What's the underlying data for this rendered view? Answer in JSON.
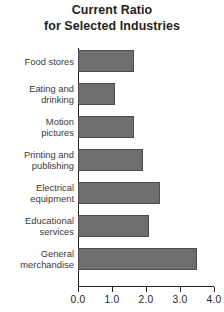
{
  "chart_data": {
    "type": "bar",
    "orientation": "horizontal",
    "title": "Current Ratio for Selected Industries",
    "title_lines": [
      "Current Ratio",
      "for Selected Industries"
    ],
    "categories": [
      "Food stores",
      "Eating and drinking",
      "Motion pictures",
      "Printing and publishing",
      "Electrical equipment",
      "Educational services",
      "General merchandise"
    ],
    "category_label_lines": [
      [
        "Food stores"
      ],
      [
        "Eating and",
        "drinking"
      ],
      [
        "Motion",
        "pictures"
      ],
      [
        "Printing and",
        "publishing"
      ],
      [
        "Electrical",
        "equipment"
      ],
      [
        "Educational",
        "services"
      ],
      [
        "General",
        "merchandise"
      ]
    ],
    "values": [
      1.65,
      1.1,
      1.65,
      1.9,
      2.4,
      2.1,
      3.5
    ],
    "xlabel": "",
    "ylabel": "",
    "xlim": [
      0.0,
      4.0
    ],
    "xticks": [
      0.0,
      1.0,
      2.0,
      3.0,
      4.0
    ],
    "xtick_labels": [
      "0.0",
      "1.0",
      "2.0",
      "3.0",
      "4.0"
    ],
    "grid": false,
    "legend": false,
    "bar_color": "#6e6e6e",
    "bar_edge_color": "#4c4c4c",
    "axis_color": "#231f20",
    "background_color": "#ffffff"
  }
}
